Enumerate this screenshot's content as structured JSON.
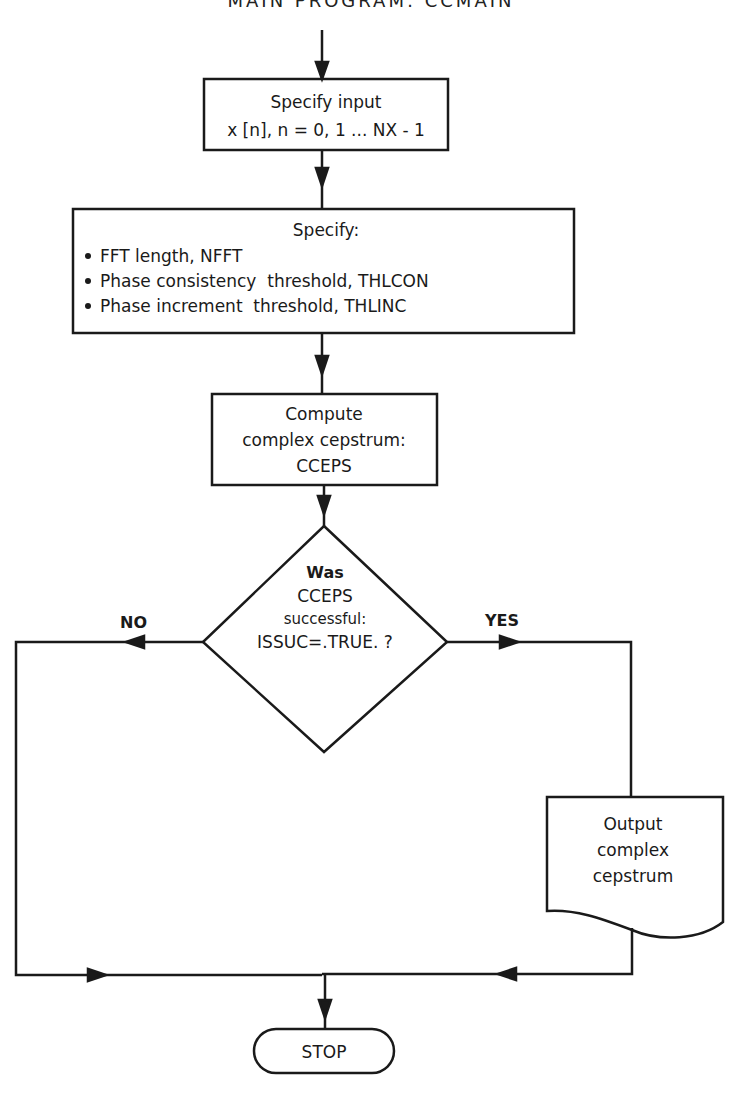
{
  "title": "MAIN PROGRAM: CCMAIN",
  "colors": {
    "line": "#1a1a1a",
    "background": "#ffffff"
  },
  "nodes": {
    "input": {
      "type": "process",
      "lines": [
        "Specify input",
        "x [n], n = 0, 1 ... NX - 1"
      ]
    },
    "params": {
      "type": "process",
      "heading": "Specify:",
      "bullets": [
        "FFT length, NFFT",
        "Phase consistency  threshold, THLCON",
        "Phase increment  threshold, THLINC"
      ]
    },
    "compute": {
      "type": "process",
      "lines": [
        "Compute",
        "complex cepstrum:",
        "CCEPS"
      ]
    },
    "decision": {
      "type": "decision",
      "lines": [
        "Was",
        "CCEPS",
        "successful:",
        "ISSUC=.TRUE. ?"
      ]
    },
    "output": {
      "type": "document",
      "lines": [
        "Output",
        "complex",
        "cepstrum"
      ]
    },
    "stop": {
      "type": "terminator",
      "label": "STOP"
    }
  },
  "edges": {
    "no_label": "NO",
    "yes_label": "YES"
  }
}
